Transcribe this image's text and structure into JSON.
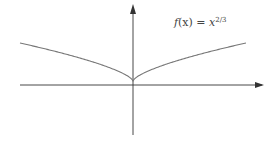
{
  "chart_data": {
    "type": "line",
    "title": "",
    "function": "f(x) = x^(2/3)",
    "series": [
      {
        "name": "f(x) = x^2/3",
        "x": [
          -1.0,
          -0.8,
          -0.6,
          -0.4,
          -0.2,
          -0.1,
          -0.02,
          0,
          0.02,
          0.1,
          0.2,
          0.4,
          0.6,
          0.8,
          1.0
        ],
        "values": [
          1.0,
          0.862,
          0.711,
          0.543,
          0.342,
          0.215,
          0.074,
          0,
          0.074,
          0.215,
          0.342,
          0.543,
          0.711,
          0.862,
          1.0
        ]
      }
    ],
    "annotations": [
      {
        "text": "f(x) = x^{2/3}",
        "position": "upper right, above curve"
      }
    ],
    "xlabel": "",
    "ylabel": "",
    "axes": {
      "arrows": [
        "x-positive",
        "y-positive"
      ],
      "ticks": "none"
    },
    "grid": false,
    "legend": "none",
    "feature": "cusp at origin"
  },
  "label": {
    "fx": "f",
    "x_arg": "(x) = ",
    "base": "x",
    "exponent": "2/3"
  },
  "colors": {
    "axis": "#333333",
    "curve": "#777777",
    "text": "#444444"
  }
}
